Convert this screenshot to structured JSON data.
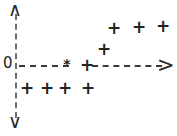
{
  "figure": {
    "title": "",
    "origin_label": "0",
    "axis_arrow_up": "∧",
    "axis_arrow_down": "∨",
    "axis_arrow_right": ">",
    "marker_glyph_plus": "+",
    "marker_glyph_star": "*",
    "colors": {
      "ink": "#232323",
      "axis": "#3a3a3a",
      "axis_vertical": "#6e6e6e",
      "background": "#ffffff"
    }
  },
  "chart_data": {
    "type": "scatter",
    "title": "",
    "xlabel": "",
    "ylabel": "",
    "xlim": [
      0,
      177
    ],
    "ylim": [
      136,
      0
    ],
    "grid": false,
    "legend": "none",
    "axes": {
      "origin_px": [
        16,
        65
      ],
      "horizontal_axis_y_px": 65,
      "vertical_axis_x_px": 16,
      "horizontal_dashed": true,
      "vertical_dashed": true,
      "arrowheads": [
        "up",
        "down",
        "right"
      ]
    },
    "series": [
      {
        "name": "plus-markers",
        "marker": "+",
        "points_px": [
          [
            27,
            88
          ],
          [
            47,
            88
          ],
          [
            65,
            88
          ],
          [
            88,
            88
          ],
          [
            87,
            65
          ],
          [
            104,
            49
          ],
          [
            114,
            28
          ],
          [
            139,
            27
          ],
          [
            163,
            26
          ]
        ]
      },
      {
        "name": "star-marker",
        "marker": "*",
        "points_px": [
          [
            67,
            64
          ]
        ]
      }
    ],
    "annotations": [
      {
        "text": "0",
        "position_px": [
          8,
          64
        ]
      },
      {
        "text": "∧",
        "position_px": [
          15,
          9
        ]
      },
      {
        "text": "∨",
        "position_px": [
          15,
          122
        ]
      },
      {
        "text": ">",
        "position_px": [
          165,
          65
        ]
      }
    ]
  }
}
